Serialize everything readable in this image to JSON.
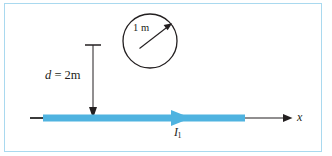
{
  "figure": {
    "background_color": "#ffffff",
    "frame_color": "#a9d9ef",
    "wire_color": "#4fb3e0",
    "line_color": "#231f20"
  },
  "labels": {
    "distance_var": "d",
    "distance_eq": " = 2m",
    "distance_full": "d = 2m",
    "radius": "1 m",
    "current_var": "I",
    "current_sub": "1",
    "current_full": "I1",
    "axis": "x"
  },
  "geometry": {
    "circle": {
      "center_x": 150,
      "center_y": 41,
      "radius": 27,
      "stroke_width": 1.3
    },
    "radius_arrow": {
      "from_x": 140,
      "from_y": 48,
      "to_x": 171,
      "to_y": 24
    },
    "wire": {
      "y": 118,
      "start_x": 43,
      "end_x": 245,
      "thickness": 7
    },
    "wire_stub": {
      "start_x": 30,
      "end_x": 44
    },
    "wire_arrow": {
      "tip_x": 191,
      "back_x": 172,
      "half_height": 8
    },
    "dimension_line": {
      "x": 93,
      "top_y": 45,
      "bottom_y": 118,
      "cap_half_width": 8
    },
    "axis_line": {
      "start_x": 245,
      "end_x": 292,
      "y": 118
    }
  }
}
